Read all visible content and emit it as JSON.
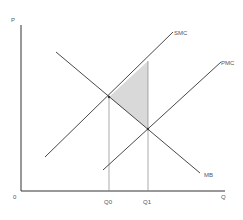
{
  "diagram": {
    "type": "economics-externality",
    "axes": {
      "y_label": "P",
      "x_label": "Q",
      "origin_label": "0"
    },
    "curves": [
      {
        "id": "smc",
        "label": "SMC",
        "description": "Social marginal cost"
      },
      {
        "id": "pmc",
        "label": "PMC",
        "description": "Private marginal cost"
      },
      {
        "id": "mb",
        "label": "MB",
        "description": "Marginal benefit"
      }
    ],
    "quantities": [
      {
        "id": "q0",
        "label": "Q0"
      },
      {
        "id": "q1",
        "label": "Q1"
      }
    ],
    "shaded_region": {
      "description": "Deadweight loss triangle",
      "fill": "#d9d9d9"
    },
    "colors": {
      "lines": "#333333",
      "guides": "#888888",
      "shade": "#d9d9d9"
    }
  }
}
